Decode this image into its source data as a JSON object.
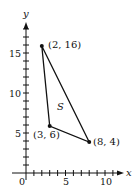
{
  "chart_data": {
    "type": "scatter",
    "title": "",
    "xlabel": "x",
    "ylabel": "y",
    "xlim": [
      0,
      11
    ],
    "ylim": [
      0,
      17
    ],
    "x_ticks": [
      "0",
      "5",
      "10"
    ],
    "y_ticks": [
      "5",
      "10",
      "15"
    ],
    "grid": false,
    "points": [
      {
        "x": 2,
        "y": 16,
        "label": "(2, 16)"
      },
      {
        "x": 3,
        "y": 6,
        "label": "(3, 6)"
      },
      {
        "x": 8,
        "y": 4,
        "label": "(8, 4)"
      }
    ],
    "region_label": "S",
    "shape": "triangle"
  },
  "labels": {
    "x_axis": "x",
    "y_axis": "y",
    "origin": "0",
    "x5": "5",
    "x10": "10",
    "y5": "5",
    "y10": "10",
    "y15": "15",
    "p1": "(2, 16)",
    "p2": "(3, 6)",
    "p3": "(8, 4)",
    "region": "S"
  }
}
